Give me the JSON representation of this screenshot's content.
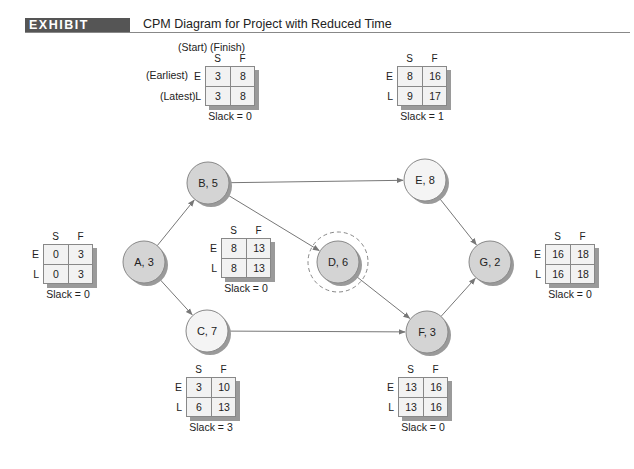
{
  "header": {
    "exhibit": "EXHIBIT 17.14",
    "title": "CPM Diagram for Project with Reduced Time"
  },
  "legend": {
    "start_finish": "(Start) (Finish)",
    "earliest": "(Earliest)",
    "latest": "(Latest)"
  },
  "labels": {
    "S": "S",
    "F": "F",
    "E": "E",
    "L": "L"
  },
  "nodes": [
    {
      "id": "A",
      "label": "A, 3",
      "cx": 144,
      "cy": 262,
      "fill": "#d4d4d4",
      "critical": true
    },
    {
      "id": "B",
      "label": "B, 5",
      "cx": 208,
      "cy": 183,
      "fill": "#d4d4d4",
      "critical": true
    },
    {
      "id": "C",
      "label": "C, 7",
      "cx": 207,
      "cy": 331,
      "fill": "#f4f4f4",
      "critical": false
    },
    {
      "id": "D",
      "label": "D, 6",
      "cx": 338,
      "cy": 262,
      "fill": "#d4d4d4",
      "critical": true,
      "highlighted": true
    },
    {
      "id": "E",
      "label": "E, 8",
      "cx": 425,
      "cy": 180,
      "fill": "#f4f4f4",
      "critical": false
    },
    {
      "id": "F",
      "label": "F, 3",
      "cx": 427,
      "cy": 332,
      "fill": "#d4d4d4",
      "critical": true
    },
    {
      "id": "G",
      "label": "G, 2",
      "cx": 490,
      "cy": 262,
      "fill": "#d4d4d4",
      "critical": true
    }
  ],
  "edges": [
    [
      "A",
      "B"
    ],
    [
      "A",
      "C"
    ],
    [
      "B",
      "E"
    ],
    [
      "B",
      "D"
    ],
    [
      "C",
      "F"
    ],
    [
      "D",
      "F"
    ],
    [
      "E",
      "G"
    ],
    [
      "F",
      "G"
    ]
  ],
  "boxes": {
    "A": {
      "ES": "0",
      "EF": "3",
      "LS": "0",
      "LF": "3",
      "slack": "Slack = 0"
    },
    "B": {
      "ES": "3",
      "EF": "8",
      "LS": "3",
      "LF": "8",
      "slack": "Slack = 0"
    },
    "C": {
      "ES": "3",
      "EF": "10",
      "LS": "6",
      "LF": "13",
      "slack": "Slack = 3"
    },
    "D": {
      "ES": "8",
      "EF": "13",
      "LS": "8",
      "LF": "13",
      "slack": "Slack = 0"
    },
    "E": {
      "ES": "8",
      "EF": "16",
      "LS": "9",
      "LF": "17",
      "slack": "Slack = 1"
    },
    "F": {
      "ES": "13",
      "EF": "16",
      "LS": "13",
      "LF": "16",
      "slack": "Slack = 0"
    },
    "G": {
      "ES": "16",
      "EF": "18",
      "LS": "16",
      "LF": "18",
      "slack": "Slack = 0"
    }
  },
  "colors": {
    "exhibit_bg": "#555555",
    "critical_node": "#d4d4d4",
    "noncritical_node": "#f4f4f4",
    "edge": "#777777"
  }
}
